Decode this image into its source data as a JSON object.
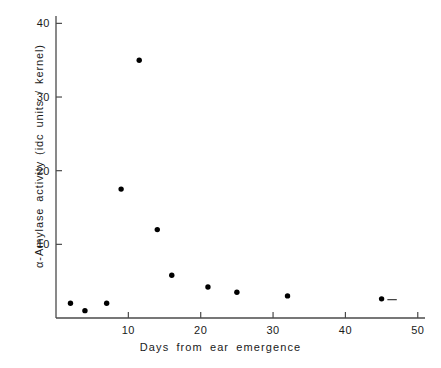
{
  "chart_data": {
    "type": "scatter",
    "title": "",
    "xlabel": "Days from ear emergence",
    "ylabel": "α-Amylase activity (idc units / kernel)",
    "xlim": [
      0,
      51
    ],
    "ylim": [
      0,
      41
    ],
    "grid": false,
    "legend": null,
    "xticks": [
      10,
      20,
      30,
      40,
      50
    ],
    "yticks": [
      10,
      20,
      30,
      40
    ],
    "xtick_labels": [
      "10",
      "20",
      "30",
      "40",
      "50"
    ],
    "ytick_labels": [
      "10",
      "20",
      "30",
      "40"
    ],
    "marker": "filled-circle",
    "marker_color": "#000000",
    "line_color": "#333333",
    "series": [
      {
        "name": "a-Amylase activity",
        "x": [
          2,
          4,
          7,
          9,
          11.5,
          14,
          16,
          21,
          25,
          32,
          45
        ],
        "y": [
          2.0,
          1.0,
          2.0,
          17.5,
          35.0,
          12.0,
          5.8,
          4.2,
          3.5,
          3.0,
          2.6
        ]
      }
    ],
    "curve_note": "smooth fitted curve through points with sharp peak at day 11.5",
    "annotations": []
  },
  "axes": {
    "x_title": "Days from ear emergence",
    "y_title": "α-Amylase activity (idc units / kernel)"
  }
}
